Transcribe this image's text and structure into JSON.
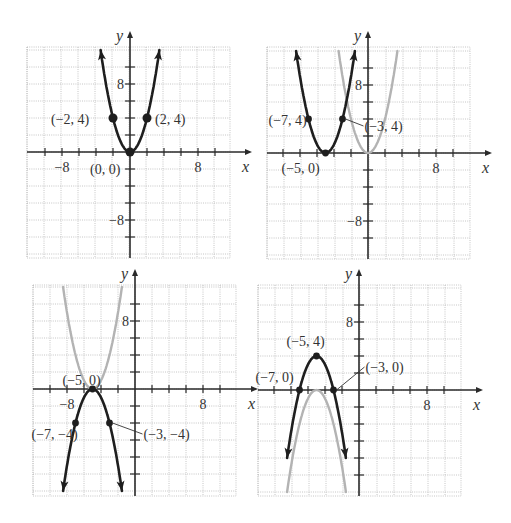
{
  "colors": {
    "main_curve": "#1e1e1e",
    "ghost_curve": "#b3b3b3",
    "grid": "#b8b8b8",
    "axis": "#2a2a2a"
  },
  "chart_data": [
    {
      "type": "line",
      "panel": "top-left",
      "title": "",
      "xlabel": "x",
      "ylabel": "y",
      "xlim": [
        -12,
        12
      ],
      "ylim": [
        -12,
        12
      ],
      "tick_step": 2,
      "tick_labels": {
        "x": [
          "-8",
          "8"
        ],
        "y": [
          "8",
          "-8"
        ]
      },
      "grid": true,
      "series": [
        {
          "name": "y = x^2",
          "style": "main",
          "formula": {
            "a": 1,
            "h": 0,
            "k": 0
          }
        }
      ],
      "points": [
        {
          "x": -2,
          "y": 4,
          "label": "(−2, 4)"
        },
        {
          "x": 0,
          "y": 0,
          "label": "(0, 0)"
        },
        {
          "x": 2,
          "y": 4,
          "label": "(2, 4)"
        }
      ]
    },
    {
      "type": "line",
      "panel": "top-right",
      "title": "",
      "xlabel": "x",
      "ylabel": "y",
      "xlim": [
        -12,
        12
      ],
      "ylim": [
        -12,
        12
      ],
      "tick_step": 2,
      "tick_labels": {
        "x": [
          "8"
        ],
        "y": [
          "8",
          "-8"
        ]
      },
      "grid": true,
      "series": [
        {
          "name": "y = x^2",
          "style": "ghost",
          "formula": {
            "a": 1,
            "h": 0,
            "k": 0
          }
        },
        {
          "name": "y = (x+5)^2",
          "style": "main",
          "formula": {
            "a": 1,
            "h": -5,
            "k": 0
          }
        }
      ],
      "points": [
        {
          "x": -7,
          "y": 4,
          "label": "(−7, 4)"
        },
        {
          "x": -5,
          "y": 0,
          "label": "(−5, 0)"
        },
        {
          "x": -3,
          "y": 4,
          "label": "(−3, 4)"
        }
      ]
    },
    {
      "type": "line",
      "panel": "bottom-left",
      "title": "",
      "xlabel": "x",
      "ylabel": "y",
      "xlim": [
        -12,
        12
      ],
      "ylim": [
        -12,
        12
      ],
      "tick_step": 2,
      "tick_labels": {
        "x": [
          "-8",
          "8"
        ],
        "y": [
          "8"
        ]
      },
      "grid": true,
      "series": [
        {
          "name": "y = (x+5)^2",
          "style": "ghost",
          "formula": {
            "a": 1,
            "h": -5,
            "k": 0
          }
        },
        {
          "name": "y = -(x+5)^2",
          "style": "main",
          "formula": {
            "a": -1,
            "h": -5,
            "k": 0
          }
        }
      ],
      "points": [
        {
          "x": -7,
          "y": -4,
          "label": "(−7, −4)"
        },
        {
          "x": -5,
          "y": 0,
          "label": "(−5, 0)"
        },
        {
          "x": -3,
          "y": -4,
          "label": "(−3, −4)"
        }
      ]
    },
    {
      "type": "line",
      "panel": "bottom-right",
      "title": "",
      "xlabel": "x",
      "ylabel": "y",
      "xlim": [
        -12,
        12
      ],
      "ylim": [
        -12,
        12
      ],
      "tick_step": 2,
      "tick_labels": {
        "x": [
          "8"
        ],
        "y": [
          "8"
        ]
      },
      "grid": true,
      "series": [
        {
          "name": "y = -(x+5)^2",
          "style": "ghost",
          "formula": {
            "a": -1,
            "h": -5,
            "k": 0
          }
        },
        {
          "name": "y = -(x+5)^2 + 4",
          "style": "main",
          "formula": {
            "a": -1,
            "h": -5,
            "k": 4
          }
        }
      ],
      "points": [
        {
          "x": -7,
          "y": 0,
          "label": "(−7, 0)"
        },
        {
          "x": -5,
          "y": 4,
          "label": "(−5, 4)"
        },
        {
          "x": -3,
          "y": 0,
          "label": "(−3, 0)"
        }
      ]
    }
  ]
}
